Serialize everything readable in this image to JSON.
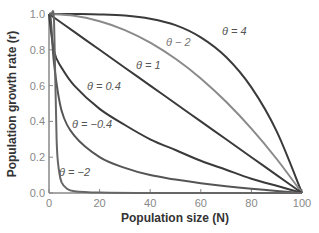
{
  "chart_data": {
    "type": "line",
    "title": "",
    "xlabel": "Population size (N)",
    "ylabel": "Population growth rate (r)",
    "xlim": [
      0,
      100
    ],
    "ylim": [
      0,
      1.0
    ],
    "x_ticks": [
      "0",
      "20",
      "40",
      "60",
      "80",
      "100"
    ],
    "y_ticks": [
      "0.0",
      "0.2",
      "0.4",
      "0.6",
      "0.8",
      "1.0"
    ],
    "grid": false,
    "legend_position": "inline labels",
    "series": [
      {
        "name": "θ = 4",
        "theta": 4,
        "color": "#3a3a3a",
        "x": [
          0,
          10,
          20,
          30,
          40,
          50,
          60,
          70,
          80,
          90,
          100
        ],
        "values": [
          1.0,
          1.0,
          0.998,
          0.992,
          0.974,
          0.938,
          0.87,
          0.76,
          0.59,
          0.344,
          0.0
        ]
      },
      {
        "name": "θ − 2",
        "theta": 2,
        "color": "#8a8a8a",
        "x": [
          0,
          10,
          20,
          30,
          40,
          50,
          60,
          70,
          80,
          90,
          100
        ],
        "values": [
          1.0,
          0.99,
          0.96,
          0.91,
          0.84,
          0.75,
          0.64,
          0.51,
          0.36,
          0.19,
          0.0
        ]
      },
      {
        "name": "θ = 1",
        "theta": 1,
        "color": "#3a3a3a",
        "x": [
          0,
          10,
          20,
          30,
          40,
          50,
          60,
          70,
          80,
          90,
          100
        ],
        "values": [
          1.0,
          0.9,
          0.8,
          0.7,
          0.6,
          0.5,
          0.4,
          0.3,
          0.2,
          0.1,
          0.0
        ]
      },
      {
        "name": "θ = 0.4",
        "theta": 0.4,
        "color": "#3a3a3a",
        "x": [
          0,
          2,
          5,
          10,
          20,
          30,
          40,
          50,
          60,
          70,
          80,
          90,
          100
        ],
        "values": [
          1.0,
          0.79,
          0.7,
          0.6,
          0.47,
          0.38,
          0.3,
          0.24,
          0.18,
          0.13,
          0.08,
          0.04,
          0.0
        ]
      },
      {
        "name": "θ = −0.4",
        "theta": -0.4,
        "color": "#555555",
        "x": [
          0.5,
          1,
          2,
          5,
          10,
          20,
          30,
          40,
          50,
          60,
          70,
          80,
          90,
          100
        ],
        "values": [
          1.0,
          0.92,
          0.72,
          0.46,
          0.32,
          0.2,
          0.14,
          0.1,
          0.075,
          0.055,
          0.038,
          0.024,
          0.011,
          0.0
        ]
      },
      {
        "name": "θ = −2",
        "theta": -2,
        "color": "#666666",
        "x": [
          0,
          1,
          2,
          3,
          4,
          5,
          7,
          10,
          20,
          40,
          60,
          80,
          100
        ],
        "values": [
          1.0,
          1.0,
          0.95,
          0.3,
          0.12,
          0.06,
          0.025,
          0.01,
          0.002,
          0.0,
          0.0,
          0.0,
          0.0
        ]
      }
    ]
  },
  "labels": {
    "theta4": "θ = 4",
    "theta2": "θ − 2",
    "theta1": "θ = 1",
    "theta04": "θ = 0.4",
    "thetaneg04": "θ = −0.4",
    "thetaneg2": "θ = −2"
  }
}
